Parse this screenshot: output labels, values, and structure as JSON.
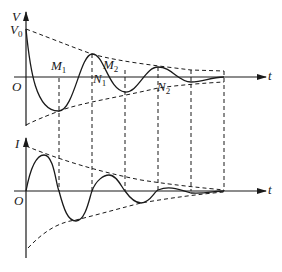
{
  "diagram": {
    "type": "damped-oscillation",
    "top_graph": {
      "y_axis_label": "V",
      "initial_value_label": "V",
      "initial_value_subscript": "0",
      "x_axis_label": "t",
      "origin_label": "O",
      "points": [
        {
          "name": "M",
          "sub": "1"
        },
        {
          "name": "N",
          "sub": "1"
        },
        {
          "name": "M",
          "sub": "2"
        },
        {
          "name": "N",
          "sub": "2"
        }
      ]
    },
    "bottom_graph": {
      "y_axis_label": "I",
      "x_axis_label": "t",
      "origin_label": "O"
    },
    "colors": {
      "line": "#1a1a1a",
      "background": "#ffffff"
    }
  }
}
